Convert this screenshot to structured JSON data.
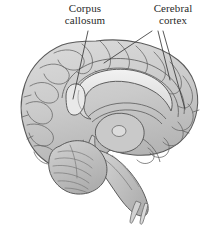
{
  "figure": {
    "type": "anatomical-illustration",
    "background_color": "#ffffff",
    "line_color": "#4a4a4a",
    "fill_light": "#d8d8d8",
    "fill_mid": "#c3c3c3",
    "fill_dark": "#a9a9a9",
    "text_color": "#2a2a2a"
  },
  "labels": [
    {
      "id": "corpus-callosum",
      "text": "Corpus\ncallosum",
      "line1": "Corpus",
      "line2": "callosum",
      "x": 54,
      "y": 3,
      "leader_count": 1
    },
    {
      "id": "cerebral-cortex",
      "text": "Cerebral\ncortex",
      "line1": "Cerebral",
      "line2": "cortex",
      "x": 142,
      "y": 3,
      "leader_count": 3
    }
  ],
  "leader_lines": [
    {
      "from_label": "corpus-callosum",
      "x1": 88,
      "y1": 31,
      "x2": 73,
      "y2": 99
    },
    {
      "from_label": "cerebral-cortex",
      "x1": 152,
      "y1": 31,
      "x2": 104,
      "y2": 63
    },
    {
      "from_label": "cerebral-cortex",
      "x1": 158,
      "y1": 31,
      "x2": 170,
      "y2": 80
    },
    {
      "from_label": "cerebral-cortex",
      "x1": 163,
      "y1": 31,
      "x2": 185,
      "y2": 109
    }
  ]
}
